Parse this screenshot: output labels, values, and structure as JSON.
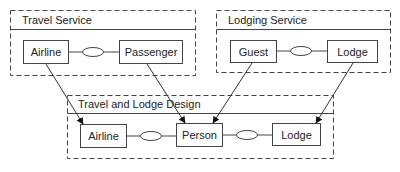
{
  "diagram": {
    "packages": [
      {
        "id": "travel-service",
        "title": "Travel Service",
        "classes": [
          "Airline",
          "Passenger"
        ],
        "associations": [
          {
            "from": "Airline",
            "to": "Passenger"
          }
        ]
      },
      {
        "id": "lodging-service",
        "title": "Lodging Service",
        "classes": [
          "Guest",
          "Lodge"
        ],
        "associations": [
          {
            "from": "Guest",
            "to": "Lodge"
          }
        ]
      },
      {
        "id": "travel-and-lodge-design",
        "title": "Travel and Lodge Design",
        "classes": [
          "Airline",
          "Person",
          "Lodge"
        ],
        "associations": [
          {
            "from": "Airline",
            "to": "Person"
          },
          {
            "from": "Person",
            "to": "Lodge"
          }
        ]
      }
    ],
    "mappings": [
      {
        "from": "Travel Service.Airline",
        "to": "Travel and Lodge Design.Airline"
      },
      {
        "from": "Travel Service.Passenger",
        "to": "Travel and Lodge Design.Person"
      },
      {
        "from": "Lodging Service.Guest",
        "to": "Travel and Lodge Design.Person"
      },
      {
        "from": "Lodging Service.Lodge",
        "to": "Travel and Lodge Design.Lodge"
      }
    ],
    "colors": {
      "stroke": "#333333",
      "background": "#ffffff"
    }
  }
}
